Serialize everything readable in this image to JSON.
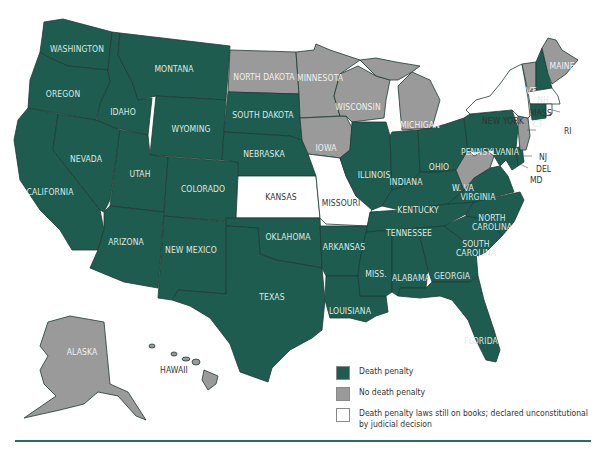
{
  "colors": {
    "death_penalty": "#1e5c4f",
    "no_death_penalty": "#9a9a9a",
    "unconstitutional": "#ffffff",
    "rule": "#2f6b5c"
  },
  "legend": [
    {
      "key": "death_penalty",
      "label": "Death penalty"
    },
    {
      "key": "no_death_penalty",
      "label": "No death penalty"
    },
    {
      "key": "unconstitutional",
      "label": "Death penalty laws still on books; declared unconstitutional by judicial decision"
    }
  ],
  "states": {
    "washington": {
      "label": "WASHINGTON",
      "status": "death_penalty"
    },
    "oregon": {
      "label": "OREGON",
      "status": "death_penalty"
    },
    "california": {
      "label": "CALIFORNIA",
      "status": "death_penalty"
    },
    "idaho": {
      "label": "IDAHO",
      "status": "death_penalty"
    },
    "nevada": {
      "label": "NEVADA",
      "status": "death_penalty"
    },
    "montana": {
      "label": "MONTANA",
      "status": "death_penalty"
    },
    "wyoming": {
      "label": "WYOMING",
      "status": "death_penalty"
    },
    "utah": {
      "label": "UTAH",
      "status": "death_penalty"
    },
    "arizona": {
      "label": "ARIZONA",
      "status": "death_penalty"
    },
    "colorado": {
      "label": "COLORADO",
      "status": "death_penalty"
    },
    "new_mexico": {
      "label": "NEW MEXICO",
      "status": "death_penalty"
    },
    "north_dakota": {
      "label": "NORTH DAKOTA",
      "status": "no_death_penalty"
    },
    "south_dakota": {
      "label": "SOUTH DAKOTA",
      "status": "death_penalty"
    },
    "nebraska": {
      "label": "NEBRASKA",
      "status": "death_penalty"
    },
    "kansas": {
      "label": "KANSAS",
      "status": "unconstitutional"
    },
    "oklahoma": {
      "label": "OKLAHOMA",
      "status": "death_penalty"
    },
    "texas": {
      "label": "TEXAS",
      "status": "death_penalty"
    },
    "minnesota": {
      "label": "MINNESOTA",
      "status": "no_death_penalty"
    },
    "iowa": {
      "label": "IOWA",
      "status": "no_death_penalty"
    },
    "missouri": {
      "label": "MISSOURI",
      "status": "unconstitutional"
    },
    "arkansas": {
      "label": "ARKANSAS",
      "status": "death_penalty"
    },
    "louisiana": {
      "label": "LOUISIANA",
      "status": "death_penalty"
    },
    "wisconsin": {
      "label": "WISCONSIN",
      "status": "no_death_penalty"
    },
    "illinois": {
      "label": "ILLINOIS",
      "status": "death_penalty"
    },
    "michigan": {
      "label": "MICHIGAN",
      "status": "no_death_penalty"
    },
    "indiana": {
      "label": "INDIANA",
      "status": "death_penalty"
    },
    "ohio": {
      "label": "OHIO",
      "status": "death_penalty"
    },
    "kentucky": {
      "label": "KENTUCKY",
      "status": "death_penalty"
    },
    "tennessee": {
      "label": "TENNESSEE",
      "status": "death_penalty"
    },
    "mississippi": {
      "label": "MISS.",
      "status": "death_penalty"
    },
    "alabama": {
      "label": "ALABAMA",
      "status": "death_penalty"
    },
    "georgia": {
      "label": "GEORGIA",
      "status": "death_penalty"
    },
    "florida": {
      "label": "FLORIDA",
      "status": "death_penalty"
    },
    "south_carolina": {
      "label": "SOUTH CAROLINA",
      "status": "death_penalty"
    },
    "north_carolina": {
      "label": "NORTH CAROLINA",
      "status": "death_penalty"
    },
    "virginia": {
      "label": "VIRGINIA",
      "status": "death_penalty"
    },
    "west_virginia": {
      "label": "W. VA",
      "status": "no_death_penalty"
    },
    "pennsylvania": {
      "label": "PENNSYLVANIA",
      "status": "death_penalty"
    },
    "new_york": {
      "label": "NEW YORK",
      "status": "unconstitutional"
    },
    "vermont": {
      "label": "VT",
      "status": "no_death_penalty"
    },
    "new_hampshire": {
      "label": "NH",
      "status": "death_penalty"
    },
    "maine": {
      "label": "MAINE",
      "status": "no_death_penalty"
    },
    "massachusetts": {
      "label": "MASS",
      "status": "unconstitutional"
    },
    "rhode_island": {
      "label": "RI",
      "status": "unconstitutional"
    },
    "connecticut": {
      "label": "CT",
      "status": "death_penalty"
    },
    "new_jersey": {
      "label": "NJ",
      "status": "no_death_penalty"
    },
    "delaware": {
      "label": "DEL",
      "status": "death_penalty"
    },
    "maryland": {
      "label": "MD",
      "status": "death_penalty"
    },
    "alaska": {
      "label": "ALASKA",
      "status": "no_death_penalty"
    },
    "hawaii": {
      "label": "HAWAII",
      "status": "no_death_penalty"
    }
  },
  "labels_multiline": {
    "north_carolina": [
      "NORTH",
      "CAROLINA"
    ],
    "south_carolina": [
      "SOUTH",
      "CAROLINA"
    ]
  }
}
